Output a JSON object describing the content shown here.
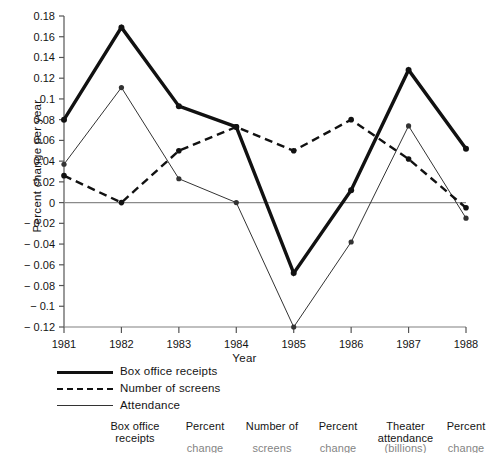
{
  "chart_data": {
    "type": "line",
    "title": "",
    "xlabel": "Year",
    "ylabel": "Percent change per year",
    "categories": [
      "1981",
      "1982",
      "1983",
      "1984",
      "1985",
      "1986",
      "1987",
      "1988"
    ],
    "x": [
      1981,
      1982,
      1983,
      1984,
      1985,
      1986,
      1987,
      1988
    ],
    "xlim": [
      1981,
      1988
    ],
    "ylim": [
      -0.12,
      0.18
    ],
    "grid": false,
    "legend_position": "below-left",
    "yticks": [
      0.18,
      0.16,
      0.14,
      0.12,
      0.1,
      0.08,
      0.06,
      0.04,
      0.02,
      0,
      -0.02,
      -0.04,
      -0.06,
      -0.08,
      -0.1,
      -0.12
    ],
    "ytick_labels": [
      "0.18",
      "0.16",
      "0.14",
      "0.12",
      "0.1",
      "0.08",
      "0.06",
      "0.04",
      "0.02",
      "0",
      "− 0.02",
      "− 0.04",
      "− 0.06",
      "− 0.08",
      "− 0.1",
      "− 0.12"
    ],
    "zero_line": 0,
    "series": [
      {
        "name": "Box office receipts",
        "style": "thick-solid",
        "color": "#111111",
        "values": [
          0.08,
          0.169,
          0.093,
          0.073,
          -0.068,
          0.012,
          0.128,
          0.052
        ]
      },
      {
        "name": "Number of screens",
        "style": "dashed",
        "color": "#111111",
        "values": [
          0.026,
          0.0,
          0.05,
          0.073,
          0.05,
          0.08,
          0.042,
          -0.005
        ]
      },
      {
        "name": "Attendance",
        "style": "thin-solid",
        "color": "#333333",
        "values": [
          0.037,
          0.111,
          0.023,
          0.0,
          -0.12,
          -0.038,
          0.074,
          -0.015
        ]
      }
    ]
  },
  "legend": {
    "items": [
      {
        "label": "Box office receipts"
      },
      {
        "label": "Number of screens"
      },
      {
        "label": "Attendance"
      }
    ]
  },
  "table_header": {
    "columns": [
      "",
      "Box office\nreceipts",
      "Percent",
      "Number of",
      "Percent",
      "Theater\nattendance",
      "Percent"
    ],
    "second_line": [
      "",
      "",
      "change",
      "screens",
      "change",
      "(billions)",
      "change"
    ]
  }
}
